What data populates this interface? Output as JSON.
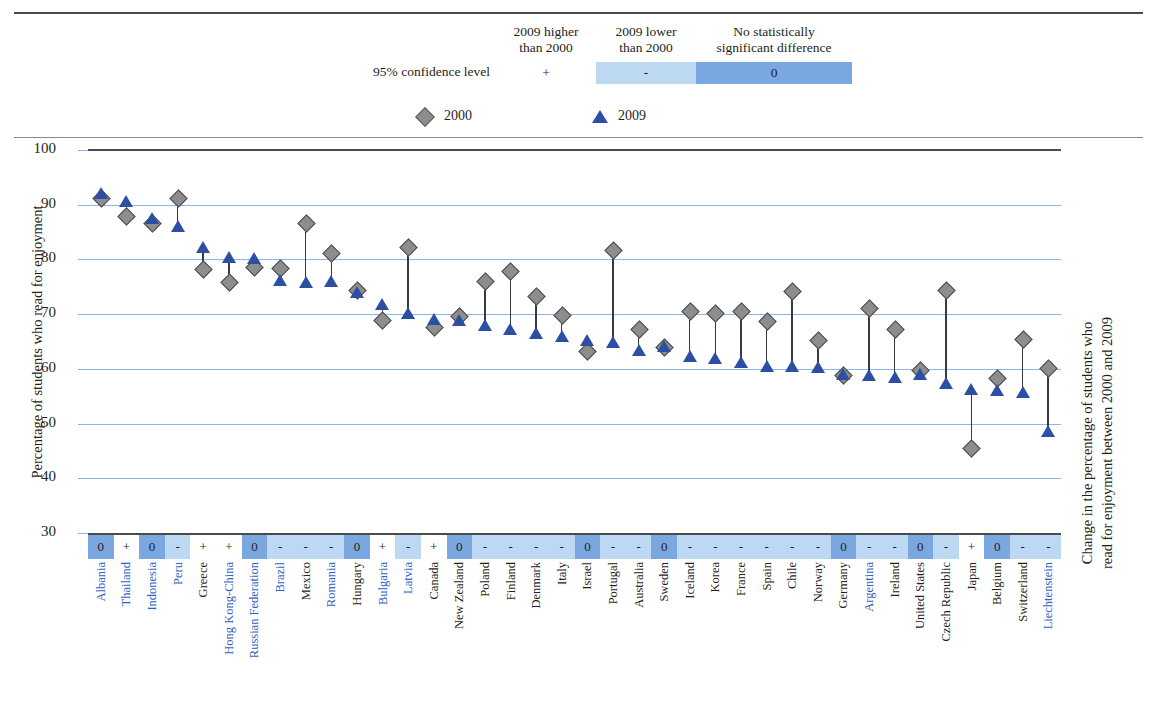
{
  "significance_legend": {
    "row_label": "95% confidence level",
    "headers": [
      "2009 higher\nthan 2000",
      "2009 lower\nthan 2000",
      "No statistically\nsignificant difference"
    ],
    "header_1_line1": "2009 higher",
    "header_1_line2": "than 2000",
    "header_2_line1": "2009 lower",
    "header_2_line2": "than 2000",
    "header_3_line1": "No statistically",
    "header_3_line2": "significant difference",
    "symbols": [
      "+",
      "-",
      "0"
    ],
    "colors": {
      "plus_bg": "#ffffff",
      "minus_bg": "#bcd8f2",
      "zero_bg": "#7ba7e0"
    }
  },
  "series_legend": [
    {
      "name": "2000",
      "marker": "diamond",
      "color": "#8d8d8d"
    },
    {
      "name": "2009",
      "marker": "triangle",
      "color": "#2c4ea3"
    }
  ],
  "axes": {
    "y_title": "Percentage of students who read for enjoyment",
    "y_ticks": [
      100,
      90,
      80,
      70,
      60,
      50,
      40,
      30
    ],
    "ylim": [
      30,
      100
    ],
    "right_title_line1": "Change in the percentage of students who",
    "right_title_line2": "read for enjoyment between 2000 and 2009"
  },
  "chart_data": {
    "type": "scatter",
    "title": "",
    "xlabel": "",
    "ylabel": "Percentage of students who read for enjoyment",
    "ylim": [
      30,
      100
    ],
    "grid": true,
    "legend_position": "top",
    "categories": [
      "Albania",
      "Thailand",
      "Indonesia",
      "Peru",
      "Greece",
      "Hong Kong-China",
      "Russian Federation",
      "Brazil",
      "Mexico",
      "Romania",
      "Hungary",
      "Bulgaria",
      "Latvia",
      "Canada",
      "New Zealand",
      "Poland",
      "Finland",
      "Denmark",
      "Italy",
      "Israel",
      "Portugal",
      "Australia",
      "Sweden",
      "Iceland",
      "Korea",
      "France",
      "Spain",
      "Chile",
      "Norway",
      "Germany",
      "Argentina",
      "Ireland",
      "United States",
      "Czech Republic",
      "Japan",
      "Belgium",
      "Switzerland",
      "Liechtenstein"
    ],
    "series": [
      {
        "name": "2000",
        "marker": "diamond",
        "color": "#8d8d8d",
        "values": [
          91.2,
          88.0,
          86.6,
          91.2,
          78.2,
          75.8,
          78.6,
          78.4,
          86.6,
          81.2,
          74.4,
          69.0,
          82.2,
          67.6,
          69.6,
          76.0,
          77.8,
          73.4,
          69.8,
          63.2,
          81.8,
          67.3,
          64.0,
          70.6,
          70.2,
          70.5,
          68.8,
          74.2,
          65.3,
          58.8,
          71.2,
          67.2,
          59.7,
          74.4,
          45.6,
          58.3,
          65.5,
          60.2
        ]
      },
      {
        "name": "2009",
        "marker": "triangle",
        "color": "#2c4ea3",
        "values": [
          92.2,
          90.6,
          87.6,
          86.2,
          82.2,
          80.4,
          80.2,
          76.2,
          75.8,
          76.0,
          74.0,
          71.8,
          70.3,
          69.1,
          68.9,
          68.0,
          67.2,
          66.6,
          66.0,
          65.2,
          64.9,
          63.4,
          64.2,
          62.4,
          61.9,
          61.3,
          60.6,
          60.6,
          60.4,
          59.1,
          58.8,
          58.6,
          59.1,
          57.4,
          56.4,
          56.1,
          55.8,
          48.6
        ]
      }
    ],
    "significance": [
      "0",
      "+",
      "0",
      "-",
      "+",
      "+",
      "0",
      "-",
      "-",
      "-",
      "0",
      "+",
      "-",
      "+",
      "0",
      "-",
      "-",
      "-",
      "-",
      "0",
      "-",
      "-",
      "0",
      "-",
      "-",
      "-",
      "-",
      "-",
      "-",
      "0",
      "-",
      "-",
      "0",
      "-",
      "+",
      "0",
      "-",
      "-"
    ],
    "label_colors": [
      "blue",
      "blue",
      "blue",
      "blue",
      "black",
      "blue",
      "blue",
      "blue",
      "black",
      "blue",
      "black",
      "blue",
      "blue",
      "black",
      "black",
      "black",
      "black",
      "black",
      "black",
      "black",
      "black",
      "black",
      "black",
      "black",
      "black",
      "black",
      "black",
      "black",
      "black",
      "black",
      "blue",
      "black",
      "black",
      "black",
      "black",
      "black",
      "black",
      "blue"
    ]
  }
}
